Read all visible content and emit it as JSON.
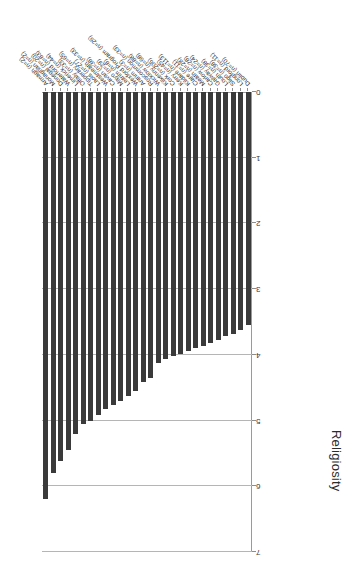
{
  "chart_data": {
    "type": "bar",
    "orientation": "horizontal",
    "title": "",
    "xlabel": "",
    "ylabel": "Religiosity",
    "ylim": [
      0,
      7
    ],
    "yticks": [
      0,
      1,
      2,
      3,
      4,
      5,
      6,
      7
    ],
    "grid": true,
    "legend": null,
    "bar_color": "#3a3a3a",
    "grid_color": "#b5b5b5",
    "axis_color": "#8d8d8d",
    "rotated_180": true,
    "categories": [
      "Dublin (n=70)",
      "Longford (n=11)",
      "Sligo (n=38)",
      "Louth (n=38)",
      "Galway (n=24)",
      "Carlow (n=28)",
      "Meath (n=28)",
      "Clare (n=11)",
      "Kildare (n=113)",
      "Kerry (n=45)",
      "Cork (n=206)",
      "Kilkenny (n=68)",
      "Wicklow (n=88)",
      "Roscommon (n=33)",
      "Antrim (n=3)",
      "Wexford Program (n=26)",
      "Leitrim (n=8)",
      "Mayo (n=29)",
      "Cavan (n=38)",
      "Westmeath (n=33)",
      "Laois (n=27)",
      "Tipperary (n=65)",
      "Offaly (n=33)",
      "Limerick (n=44)",
      "Waterford (n=83)",
      "Donegal (n=20)",
      "Monaghan (n=2)",
      "Armagh (n=2)"
    ],
    "values": [
      3.55,
      3.62,
      3.68,
      3.72,
      3.78,
      3.82,
      3.86,
      3.9,
      3.94,
      3.98,
      4.02,
      4.06,
      4.12,
      4.35,
      4.42,
      4.55,
      4.62,
      4.7,
      4.76,
      4.82,
      4.92,
      5.0,
      5.05,
      5.2,
      5.45,
      5.62,
      5.8,
      6.2
    ]
  }
}
